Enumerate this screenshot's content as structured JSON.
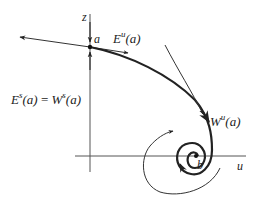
{
  "diagram": {
    "type": "phase-portrait",
    "colors": {
      "ink": "#222222",
      "background": "#ffffff",
      "axis": "#555555"
    },
    "axes": {
      "vertical": {
        "label": "z"
      },
      "horizontal": {
        "label": "u"
      }
    },
    "points": {
      "a": {
        "label": "a"
      },
      "b": {
        "label": "b"
      }
    },
    "labels": {
      "unstable_eigenspace": {
        "base": "E",
        "sup": "u",
        "arg": "(a)"
      },
      "stable_eigenspace_lhs": {
        "base": "E",
        "sup": "s",
        "arg": "(a)"
      },
      "equals": "=",
      "stable_manifold_rhs": {
        "base": "W",
        "sup": "s",
        "arg": "(a)"
      },
      "unstable_manifold": {
        "base": "W",
        "sup": "u",
        "arg": "(a)"
      }
    }
  }
}
